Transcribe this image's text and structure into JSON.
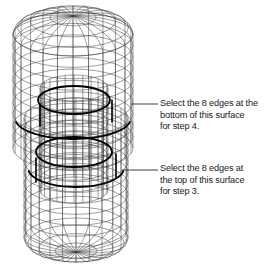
{
  "figure": {
    "background_color": "#ffffff",
    "line_color": "#3a3a3a",
    "highlight_color": "#000000",
    "annotations": [
      {
        "id": "annotation-bottom-surface",
        "text": "Select the 8 edges at the\nbottom of this surface\nfor step 4.",
        "step": "4",
        "edge_count": "8",
        "leader": {
          "x1": 131,
          "y1": 104,
          "x2": 158,
          "y2": 104
        }
      },
      {
        "id": "annotation-top-surface",
        "text": "Select the 8 edges at\nthe top of this surface\nfor step 3.",
        "step": "3",
        "edge_count": "8",
        "leader": {
          "x1": 122,
          "y1": 170,
          "x2": 158,
          "y2": 170
        }
      }
    ],
    "geometry": {
      "shape": "two stacked cylindrical mesh surfaces",
      "upper_cylinder": {
        "cx": 73,
        "top_y": 16,
        "bottom_y": 148,
        "rx": 60,
        "ry": 22
      },
      "lower_cylinder": {
        "cx": 76,
        "top_y": 118,
        "bottom_y": 252,
        "rx": 52,
        "ry": 20
      },
      "inner_cylinder": {
        "cx": 74,
        "top_y": 88,
        "bottom_y": 190,
        "rx": 34,
        "ry": 13
      },
      "meridian_count": 24,
      "latitude_count": 12
    }
  }
}
